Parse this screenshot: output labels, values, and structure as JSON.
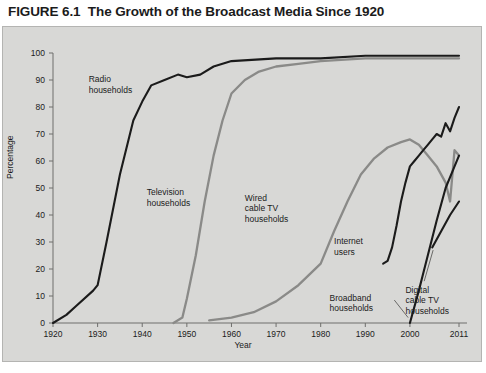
{
  "figure": {
    "number": "FIGURE 6.1",
    "title": "The Growth of the Broadcast Media Since 1920"
  },
  "chart_data": {
    "type": "line",
    "title": "The Growth of the Broadcast Media Since 1920",
    "xlabel": "Year",
    "ylabel": "Percentage",
    "xlim": [
      1920,
      2011
    ],
    "ylim": [
      0,
      100
    ],
    "xticks": [
      1920,
      1930,
      1940,
      1950,
      1960,
      1970,
      1980,
      1990,
      2000,
      2011
    ],
    "yticks": [
      0,
      10,
      20,
      30,
      40,
      50,
      60,
      70,
      80,
      90,
      100
    ],
    "grid": false,
    "legend": "inline-annotations",
    "colors": {
      "black": "#1b1b1b",
      "gray": "#8a8a88",
      "background": "#d8d8d6"
    },
    "series": [
      {
        "name": "Radio households",
        "color": "#1b1b1b",
        "points": [
          [
            1920,
            0
          ],
          [
            1923,
            3
          ],
          [
            1925,
            6
          ],
          [
            1929,
            12
          ],
          [
            1930,
            14
          ],
          [
            1932,
            30
          ],
          [
            1935,
            55
          ],
          [
            1938,
            75
          ],
          [
            1940,
            82
          ],
          [
            1942,
            88
          ],
          [
            1945,
            90
          ],
          [
            1948,
            92
          ],
          [
            1950,
            91
          ],
          [
            1953,
            92
          ],
          [
            1956,
            95
          ],
          [
            1960,
            97
          ],
          [
            1970,
            98
          ],
          [
            1980,
            98
          ],
          [
            1990,
            99
          ],
          [
            2000,
            99
          ],
          [
            2011,
            99
          ]
        ]
      },
      {
        "name": "Television households",
        "color": "#8a8a88",
        "points": [
          [
            1947,
            0
          ],
          [
            1949,
            2
          ],
          [
            1950,
            9
          ],
          [
            1952,
            25
          ],
          [
            1954,
            45
          ],
          [
            1956,
            62
          ],
          [
            1958,
            75
          ],
          [
            1960,
            85
          ],
          [
            1963,
            90
          ],
          [
            1966,
            93
          ],
          [
            1970,
            95
          ],
          [
            1975,
            96
          ],
          [
            1980,
            97
          ],
          [
            1990,
            98
          ],
          [
            2000,
            98
          ],
          [
            2011,
            98
          ]
        ]
      },
      {
        "name": "Wired cable TV households",
        "color": "#8a8a88",
        "points": [
          [
            1955,
            1
          ],
          [
            1960,
            2
          ],
          [
            1965,
            4
          ],
          [
            1970,
            8
          ],
          [
            1975,
            14
          ],
          [
            1980,
            22
          ],
          [
            1983,
            34
          ],
          [
            1986,
            45
          ],
          [
            1989,
            55
          ],
          [
            1992,
            61
          ],
          [
            1995,
            65
          ],
          [
            1998,
            67
          ],
          [
            2000,
            68
          ],
          [
            2002,
            66
          ],
          [
            2004,
            62
          ],
          [
            2006,
            58
          ],
          [
            2008,
            52
          ],
          [
            2009,
            45
          ],
          [
            2010,
            64
          ],
          [
            2011,
            62
          ]
        ]
      },
      {
        "name": "Internet users",
        "color": "#1b1b1b",
        "points": [
          [
            1994,
            22
          ],
          [
            1995,
            23
          ],
          [
            1996,
            28
          ],
          [
            1997,
            36
          ],
          [
            1998,
            45
          ],
          [
            1999,
            52
          ],
          [
            2000,
            58
          ],
          [
            2001,
            60
          ],
          [
            2002,
            62
          ],
          [
            2003,
            64
          ],
          [
            2004,
            66
          ],
          [
            2005,
            68
          ],
          [
            2006,
            70
          ],
          [
            2007,
            69
          ],
          [
            2008,
            74
          ],
          [
            2009,
            71
          ],
          [
            2010,
            76
          ],
          [
            2011,
            80
          ]
        ]
      },
      {
        "name": "Broadband households",
        "color": "#1b1b1b",
        "points": [
          [
            2000,
            0
          ],
          [
            2002,
            12
          ],
          [
            2004,
            25
          ],
          [
            2006,
            38
          ],
          [
            2008,
            50
          ],
          [
            2010,
            58
          ],
          [
            2011,
            62
          ]
        ]
      },
      {
        "name": "Digital cable TV households",
        "color": "#1b1b1b",
        "points": [
          [
            2005,
            28
          ],
          [
            2007,
            34
          ],
          [
            2009,
            40
          ],
          [
            2011,
            45
          ]
        ]
      }
    ],
    "annotations": [
      {
        "id": "radio",
        "text": "Radio\nhouseholds",
        "x": 1928,
        "y": 90
      },
      {
        "id": "television",
        "text": "Television\nhouseholds",
        "x": 1941,
        "y": 48
      },
      {
        "id": "wired-cable",
        "text": "Wired\ncable TV\nhouseholds",
        "x": 1963,
        "y": 46
      },
      {
        "id": "internet",
        "text": "Internet\nusers",
        "x": 1983,
        "y": 30
      },
      {
        "id": "broadband",
        "text": "Broadband\nhouseholds",
        "x": 1982,
        "y": 9
      },
      {
        "id": "digital-cable",
        "text": "Digital\ncable TV\nhouseholds",
        "x": 1999,
        "y": 12
      }
    ]
  },
  "axis": {
    "y_ticks": [
      "100",
      "90",
      "80",
      "70",
      "60",
      "50",
      "40",
      "30",
      "20",
      "10",
      "0"
    ],
    "x_ticks": [
      "1920",
      "1930",
      "1940",
      "1950",
      "1960",
      "1970",
      "1980",
      "1990",
      "2000",
      "2011"
    ],
    "y_title": "Percentage",
    "x_title": "Year"
  },
  "annotations": {
    "radio": "Radio\nhouseholds",
    "television": "Television\nhouseholds",
    "wired_cable": "Wired\ncable TV\nhouseholds",
    "internet": "Internet\nusers",
    "broadband": "Broadband\nhouseholds",
    "digital_cable": "Digital\ncable TV\nhouseholds"
  }
}
